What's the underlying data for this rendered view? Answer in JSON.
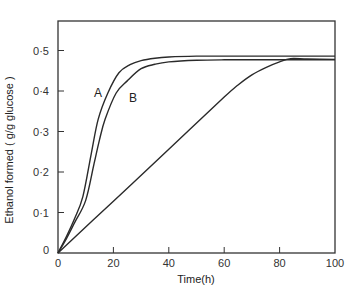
{
  "chart_data": {
    "type": "line",
    "title": "",
    "xlabel": "Time(h)",
    "ylabel": "Ethanol formed ( g/g glucose )",
    "xlim": [
      0,
      100
    ],
    "ylim": [
      0,
      0.58
    ],
    "grid": false,
    "legend": "inline labels",
    "x_ticks": [
      0,
      20,
      40,
      60,
      80,
      100
    ],
    "x_tick_labels": [
      "0",
      "20",
      "40",
      "60",
      "80",
      "100"
    ],
    "y_ticks": [
      0,
      0.1,
      0.2,
      0.3,
      0.4,
      0.5
    ],
    "y_tick_labels": [
      "0",
      "0·1",
      "0·2",
      "0·3",
      "0·4",
      "0·5"
    ],
    "series": [
      {
        "name": "A",
        "x": [
          0,
          3,
          6,
          9,
          12,
          14.5,
          18,
          22,
          26,
          30,
          35,
          40,
          50,
          60,
          80,
          100
        ],
        "values": [
          0,
          0.04,
          0.085,
          0.14,
          0.245,
          0.33,
          0.395,
          0.445,
          0.465,
          0.475,
          0.481,
          0.484,
          0.486,
          0.486,
          0.486,
          0.486
        ]
      },
      {
        "name": "B",
        "x": [
          0,
          3,
          6,
          10,
          13,
          15,
          17,
          21,
          25,
          30,
          35,
          40,
          50,
          60,
          80,
          100
        ],
        "values": [
          0,
          0.035,
          0.075,
          0.13,
          0.22,
          0.28,
          0.33,
          0.395,
          0.425,
          0.455,
          0.466,
          0.472,
          0.476,
          0.477,
          0.477,
          0.477
        ]
      },
      {
        "name": "C (unlabeled)",
        "x": [
          0,
          20,
          40,
          60,
          65,
          70,
          75,
          80,
          84,
          90,
          100
        ],
        "values": [
          0,
          0.128,
          0.256,
          0.385,
          0.415,
          0.44,
          0.458,
          0.472,
          0.48,
          0.479,
          0.478
        ]
      }
    ],
    "annotations": [
      {
        "text": "A",
        "x": 14.5,
        "y": 0.395
      },
      {
        "text": "B",
        "x": 27,
        "y": 0.385
      }
    ]
  },
  "labels": {
    "series_a": "A",
    "series_b": "B",
    "xlabel": "Time(h)",
    "ylabel": "Ethanol formed ( g/g glucose )"
  }
}
